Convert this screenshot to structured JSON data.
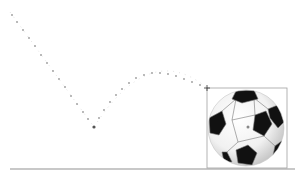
{
  "scene": {
    "title": "Bouncing soccer ball motion path",
    "background": "#ffffff",
    "ground": {
      "y": 169,
      "x1": 10,
      "x2": 295,
      "color": "#c8c8c8"
    },
    "path": {
      "color": "#9a9a9a",
      "start": [
        10,
        12
      ],
      "bounce": [
        94,
        127
      ],
      "peak": [
        152,
        73
      ],
      "end": [
        207,
        88
      ]
    },
    "selection_box": {
      "x": 207,
      "y": 88,
      "width": 80,
      "height": 80,
      "color": "#a0a0a0"
    },
    "ball": {
      "cx": 246,
      "cy": 128,
      "r": 38,
      "light": "#ffffff",
      "shade": "#d4d4d4",
      "dark": "#111111"
    }
  }
}
